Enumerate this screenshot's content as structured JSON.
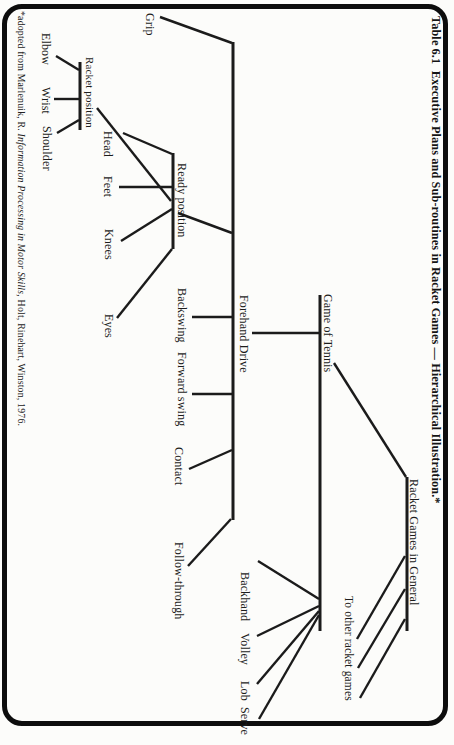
{
  "page": {
    "title": "Table 6.1  Executive Plans and Sub-routines in Racket Games — Hierarchical Illustration.*",
    "footnote": {
      "prefix": "*adopted from Marlenuik, R. ",
      "book_title": "Information Processing in Motor Skills,",
      "suffix": " Holt, Rinehart, Winston, 1976."
    }
  },
  "tree": {
    "root": {
      "label": "Racket Games in General"
    },
    "to_other": {
      "label": "To other racket games"
    },
    "game_of_tennis": {
      "label": "Game of Tennis"
    },
    "strokes": {
      "backhand": "Backhand",
      "volley": "Volley",
      "lob": "Lob",
      "serve": "Serve"
    },
    "forehand_drive": {
      "label": "Forehand Drive"
    },
    "forehand_children": {
      "grip": "Grip",
      "ready_position": "Ready position",
      "backswing": "Backswing",
      "forward_swing": "Forward swing",
      "contact": "Contact",
      "follow_through": "Follow-through"
    },
    "ready_children": {
      "head": "Head",
      "feet": "Feet",
      "knees": "Knees",
      "eyes": "Eyes",
      "racket_position": "Racket position"
    },
    "racket_children": {
      "elbow": "Elbow",
      "wrist": "Wrist",
      "shoulder": "Shoulder"
    }
  }
}
